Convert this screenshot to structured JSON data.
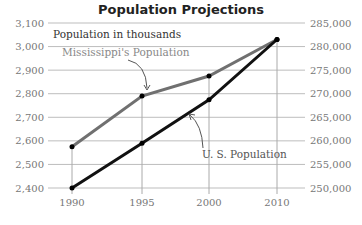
{
  "chart_data": {
    "type": "line",
    "title": "Population Projections",
    "subtitle": "Population in thousands",
    "x": [
      "1990",
      "1995",
      "2000",
      "2010"
    ],
    "series": [
      {
        "name": "Mississippi's Population",
        "axis": "left",
        "color": "#707070",
        "values": [
          2575,
          2790,
          2875,
          3030
        ]
      },
      {
        "name": "U. S. Population",
        "axis": "right",
        "color": "#111111",
        "values": [
          250000,
          259500,
          268700,
          281500
        ]
      }
    ],
    "left_axis": {
      "ticks": [
        "3,100",
        "3,000",
        "2,900",
        "2,800",
        "2,700",
        "2,600",
        "2,500",
        "2,400"
      ],
      "ylim": [
        2400,
        3100
      ]
    },
    "right_axis": {
      "ticks": [
        "285,000",
        "280,000",
        "275,000",
        "270,000",
        "265,000",
        "260,000",
        "255,000",
        "250,000"
      ],
      "ylim": [
        250000,
        285000
      ]
    },
    "xlabel": "",
    "ylabel": "Population in thousands",
    "grid": true
  },
  "labels": {
    "title": "Population Projections",
    "subtitle": "Population in thousands",
    "ms_label": "Mississippi's Population",
    "us_label": "U. S. Population"
  }
}
